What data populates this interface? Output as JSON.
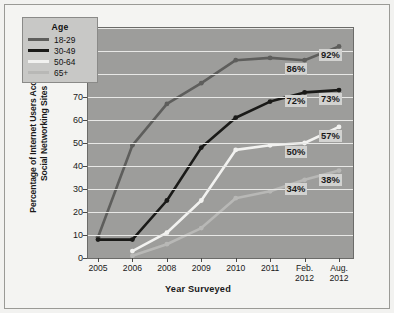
{
  "chart_data": {
    "type": "line",
    "title": "",
    "xlabel": "Year Surveyed",
    "ylabel": "Percentage of Internet Users Accessing Social Networking Sites",
    "ylabel_lines": [
      "Percentage of Internet Users Accessing",
      "Social Networking Sites"
    ],
    "categories": [
      "2005",
      "2006",
      "2008",
      "2009",
      "2010",
      "2011",
      "Feb. 2012",
      "Aug. 2012"
    ],
    "x_tick_lines": [
      [
        "2005"
      ],
      [
        "2006"
      ],
      [
        "2008"
      ],
      [
        "2009"
      ],
      [
        "2010"
      ],
      [
        "2011"
      ],
      [
        "Feb.",
        "2012"
      ],
      [
        "Aug.",
        "2012"
      ]
    ],
    "ylim": [
      0,
      100
    ],
    "y_ticks": [
      0,
      10,
      20,
      30,
      40,
      50,
      60,
      70,
      80,
      90,
      100
    ],
    "grid": true,
    "legend_position": "top-left",
    "legend_title": "Age",
    "series": [
      {
        "name": "18-29",
        "color": "#5e5e5c",
        "values": [
          9,
          49,
          67,
          76,
          86,
          87,
          86,
          92
        ],
        "end_labels": [
          {
            "index": 6,
            "text": "86%"
          },
          {
            "index": 7,
            "text": "92%"
          }
        ]
      },
      {
        "name": "30-49",
        "color": "#1a1a18",
        "values": [
          8,
          8,
          25,
          48,
          61,
          68,
          72,
          73
        ],
        "end_labels": [
          {
            "index": 6,
            "text": "72%"
          },
          {
            "index": 7,
            "text": "73%"
          }
        ]
      },
      {
        "name": "50-64",
        "color": "#f2f2f0",
        "values": [
          null,
          3,
          11,
          25,
          47,
          49,
          50,
          57
        ],
        "end_labels": [
          {
            "index": 6,
            "text": "50%"
          },
          {
            "index": 7,
            "text": "57%"
          }
        ]
      },
      {
        "name": "65+",
        "color": "#b8b8b6",
        "values": [
          null,
          1,
          6,
          13,
          26,
          29,
          34,
          38
        ],
        "end_labels": [
          {
            "index": 6,
            "text": "34%"
          },
          {
            "index": 7,
            "text": "38%"
          }
        ]
      }
    ]
  },
  "figure": {
    "plot_bg": "#9d9d9b",
    "page_bg": "#f4f4f2",
    "grid_color": "#e8e8e6",
    "label_bg": "#d2d2d0"
  }
}
